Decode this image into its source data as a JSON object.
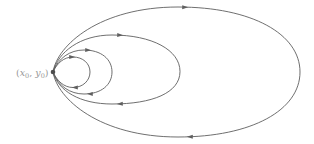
{
  "figure": {
    "background_color": "#ffffff",
    "curve_color": "#5f5f5f",
    "curve_width": 0.9,
    "base_point": {
      "label_text": "(x0, y0)",
      "label_parts": [
        {
          "t": "(",
          "italic": false,
          "sub": false
        },
        {
          "t": "x",
          "italic": true,
          "sub": false
        },
        {
          "t": "0",
          "italic": false,
          "sub": true
        },
        {
          "t": ", ",
          "italic": false,
          "sub": false
        },
        {
          "t": "y",
          "italic": true,
          "sub": false
        },
        {
          "t": "0",
          "italic": false,
          "sub": true
        },
        {
          "t": ")",
          "italic": false,
          "sub": false
        }
      ],
      "label_color": "#989898",
      "label_font_size": 9.5,
      "label_sub_font_size": 6.5,
      "label_x": 48.5,
      "label_y": 75.8,
      "dot_cx": 53,
      "dot_cy": 72,
      "dot_r": 2.3,
      "dot_color": "#4d4d4d"
    },
    "loops": [
      {
        "name": "loop-1-innermost",
        "d": "M53,72 C57,63 64,57 73,57 C83,57 90,63.5 90,72 C90,80.5 83,87.5 73,87.5 C64,87.5 57,81 53,72 Z",
        "extent": {
          "top_y": 57,
          "right_x": 90,
          "bottom_y": 87.5
        },
        "arrows": [
          {
            "x": 72,
            "y": 57,
            "angle": 0
          },
          {
            "x": 75,
            "y": 87.6,
            "angle": 180
          }
        ]
      },
      {
        "name": "loop-2",
        "d": "M53,72 C58,58 70,50 84,50 C101,50 112,59 112,72 C112,85 101,94 84,94 C70,94 58,86 53,72 Z",
        "extent": {
          "top_y": 50,
          "right_x": 112,
          "bottom_y": 94
        },
        "arrows": [
          {
            "x": 88,
            "y": 50.2,
            "angle": 2
          },
          {
            "x": 90,
            "y": 93.8,
            "angle": 182
          }
        ]
      },
      {
        "name": "loop-3",
        "d": "M53,72 C58,52 80,35 112,35 C152,35 180,50 180,71.5 C180,93 152,104 112,104 C80,104 58,91 53,72 Z",
        "extent": {
          "top_y": 35,
          "right_x": 180,
          "bottom_y": 104
        },
        "arrows": [
          {
            "x": 120,
            "y": 35.2,
            "angle": 2
          },
          {
            "x": 120,
            "y": 103.8,
            "angle": 178
          }
        ]
      },
      {
        "name": "loop-4-outermost",
        "d": "M53,72 C57,45 100,7 178,7 C252,7 300,34 300,72 C300,110 252,137 178,137 C100,137 57,99 53,72 Z",
        "extent": {
          "top_y": 7,
          "right_x": 300,
          "bottom_y": 137
        },
        "arrows": [
          {
            "x": 185,
            "y": 7.2,
            "angle": 1
          },
          {
            "x": 190,
            "y": 136.8,
            "angle": 181
          }
        ]
      }
    ],
    "arrow_shape": {
      "points": "-2.8,-2 3.2,0 -2.8,2"
    },
    "canvas": {
      "width": 314,
      "height": 144
    }
  }
}
